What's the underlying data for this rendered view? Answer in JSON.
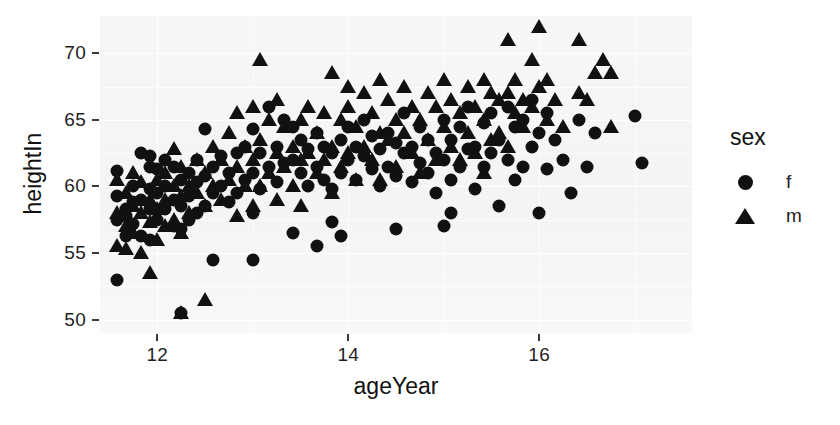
{
  "chart_data": {
    "type": "scatter",
    "title": "",
    "xlabel": "ageYear",
    "ylabel": "heightIn",
    "xlim": [
      11.4,
      17.6
    ],
    "ylim": [
      49.0,
      72.8
    ],
    "xticks": [
      12,
      14,
      16
    ],
    "yticks": [
      50,
      55,
      60,
      65,
      70
    ],
    "xtick_labels": [
      "12",
      "14",
      "16"
    ],
    "ytick_labels": [
      "50",
      "55",
      "60",
      "65",
      "70"
    ],
    "grid": true,
    "grid_major_color": "#ffffff",
    "panel_background": "#f4f4f4",
    "marker_color": "#111111",
    "legend": {
      "title": "sex",
      "position": "right",
      "entries": [
        {
          "label": "f",
          "marker": "circle"
        },
        {
          "label": "m",
          "marker": "triangle"
        }
      ]
    },
    "series": [
      {
        "name": "f",
        "marker": "circle",
        "points": [
          [
            11.92,
            62.3
          ],
          [
            11.92,
            61.5
          ],
          [
            11.58,
            61.2
          ],
          [
            11.58,
            59.3
          ],
          [
            11.58,
            57.5
          ],
          [
            11.67,
            58.3
          ],
          [
            11.67,
            57.8
          ],
          [
            11.67,
            56.3
          ],
          [
            11.75,
            60.0
          ],
          [
            11.75,
            58.8
          ],
          [
            11.75,
            57.2
          ],
          [
            11.83,
            62.5
          ],
          [
            11.83,
            59.0
          ],
          [
            11.83,
            56.3
          ],
          [
            11.92,
            59.8
          ],
          [
            11.92,
            58.3
          ],
          [
            11.92,
            56.0
          ],
          [
            11.58,
            53.0
          ],
          [
            12.0,
            61.3
          ],
          [
            12.0,
            59.5
          ],
          [
            12.0,
            57.5
          ],
          [
            12.08,
            62.0
          ],
          [
            12.08,
            60.0
          ],
          [
            12.08,
            58.3
          ],
          [
            12.17,
            61.5
          ],
          [
            12.17,
            59.0
          ],
          [
            12.17,
            57.0
          ],
          [
            12.25,
            60.5
          ],
          [
            12.25,
            58.5
          ],
          [
            12.25,
            56.8
          ],
          [
            12.25,
            50.5
          ],
          [
            12.33,
            61.0
          ],
          [
            12.33,
            59.3
          ],
          [
            12.33,
            57.5
          ],
          [
            12.42,
            62.0
          ],
          [
            12.42,
            60.3
          ],
          [
            12.42,
            58.0
          ],
          [
            12.5,
            64.3
          ],
          [
            12.5,
            60.8
          ],
          [
            12.5,
            58.5
          ],
          [
            12.58,
            61.5
          ],
          [
            12.58,
            59.5
          ],
          [
            12.58,
            54.5
          ],
          [
            12.67,
            62.3
          ],
          [
            12.67,
            60.0
          ],
          [
            12.75,
            61.0
          ],
          [
            12.75,
            58.8
          ],
          [
            12.83,
            62.5
          ],
          [
            12.83,
            59.5
          ],
          [
            12.92,
            63.0
          ],
          [
            12.92,
            60.5
          ],
          [
            13.0,
            64.3
          ],
          [
            13.0,
            61.0
          ],
          [
            13.0,
            58.0
          ],
          [
            13.0,
            54.5
          ],
          [
            13.08,
            62.5
          ],
          [
            13.08,
            59.8
          ],
          [
            13.17,
            66.0
          ],
          [
            13.17,
            61.5
          ],
          [
            13.25,
            63.0
          ],
          [
            13.25,
            60.3
          ],
          [
            13.33,
            65.0
          ],
          [
            13.33,
            61.8
          ],
          [
            13.42,
            64.5
          ],
          [
            13.42,
            62.0
          ],
          [
            13.42,
            56.5
          ],
          [
            13.5,
            63.5
          ],
          [
            13.5,
            61.0
          ],
          [
            13.58,
            62.8
          ],
          [
            13.58,
            60.0
          ],
          [
            13.67,
            64.0
          ],
          [
            13.67,
            61.5
          ],
          [
            13.67,
            55.5
          ],
          [
            13.75,
            63.0
          ],
          [
            13.75,
            60.5
          ],
          [
            13.83,
            62.5
          ],
          [
            13.83,
            59.8
          ],
          [
            13.92,
            63.5
          ],
          [
            13.92,
            61.0
          ],
          [
            14.0,
            64.5
          ],
          [
            14.0,
            62.0
          ],
          [
            14.08,
            63.0
          ],
          [
            14.08,
            60.5
          ],
          [
            14.17,
            65.0
          ],
          [
            14.17,
            62.3
          ],
          [
            14.25,
            63.8
          ],
          [
            14.25,
            61.3
          ],
          [
            14.33,
            62.8
          ],
          [
            14.33,
            60.0
          ],
          [
            14.42,
            64.0
          ],
          [
            14.42,
            61.5
          ],
          [
            14.5,
            63.3
          ],
          [
            14.5,
            60.8
          ],
          [
            14.58,
            65.5
          ],
          [
            14.58,
            62.5
          ],
          [
            14.67,
            63.0
          ],
          [
            14.67,
            60.3
          ],
          [
            14.75,
            64.5
          ],
          [
            14.75,
            61.8
          ],
          [
            14.83,
            63.5
          ],
          [
            14.83,
            61.0
          ],
          [
            14.92,
            62.5
          ],
          [
            14.92,
            59.5
          ],
          [
            15.0,
            65.0
          ],
          [
            15.0,
            62.0
          ],
          [
            15.08,
            63.5
          ],
          [
            15.08,
            60.5
          ],
          [
            15.17,
            64.5
          ],
          [
            15.17,
            61.5
          ],
          [
            15.25,
            66.0
          ],
          [
            15.25,
            62.8
          ],
          [
            15.33,
            63.0
          ],
          [
            15.33,
            59.8
          ],
          [
            15.42,
            64.8
          ],
          [
            15.42,
            61.5
          ],
          [
            15.5,
            65.5
          ],
          [
            15.5,
            62.5
          ],
          [
            15.58,
            63.5
          ],
          [
            15.58,
            58.5
          ],
          [
            15.67,
            66.0
          ],
          [
            15.67,
            62.0
          ],
          [
            15.75,
            64.5
          ],
          [
            15.75,
            60.5
          ],
          [
            15.83,
            65.0
          ],
          [
            15.83,
            61.5
          ],
          [
            15.92,
            66.5
          ],
          [
            15.92,
            63.0
          ],
          [
            16.0,
            64.0
          ],
          [
            16.0,
            58.0
          ],
          [
            16.08,
            65.5
          ],
          [
            16.08,
            61.3
          ],
          [
            16.17,
            63.5
          ],
          [
            16.25,
            62.0
          ],
          [
            16.33,
            59.5
          ],
          [
            16.42,
            65.0
          ],
          [
            16.5,
            61.5
          ],
          [
            16.58,
            64.0
          ],
          [
            17.0,
            65.3
          ],
          [
            17.08,
            61.8
          ],
          [
            14.5,
            56.8
          ],
          [
            15.0,
            57.0
          ],
          [
            15.08,
            58.0
          ],
          [
            13.83,
            57.3
          ],
          [
            13.92,
            56.3
          ]
        ]
      },
      {
        "name": "m",
        "marker": "triangle",
        "points": [
          [
            11.58,
            55.5
          ],
          [
            11.58,
            58.0
          ],
          [
            11.58,
            60.5
          ],
          [
            11.67,
            59.5
          ],
          [
            11.67,
            57.0
          ],
          [
            11.67,
            55.3
          ],
          [
            11.75,
            61.0
          ],
          [
            11.75,
            58.5
          ],
          [
            11.75,
            56.5
          ],
          [
            11.83,
            60.3
          ],
          [
            11.83,
            58.0
          ],
          [
            11.83,
            55.0
          ],
          [
            11.92,
            59.0
          ],
          [
            11.92,
            57.3
          ],
          [
            11.92,
            53.5
          ],
          [
            12.0,
            60.5
          ],
          [
            12.0,
            58.3
          ],
          [
            12.0,
            56.0
          ],
          [
            12.08,
            61.0
          ],
          [
            12.08,
            59.0
          ],
          [
            12.08,
            57.0
          ],
          [
            12.17,
            62.8
          ],
          [
            12.17,
            60.0
          ],
          [
            12.17,
            57.5
          ],
          [
            12.25,
            61.5
          ],
          [
            12.25,
            59.3
          ],
          [
            12.25,
            56.5
          ],
          [
            12.25,
            50.5
          ],
          [
            12.33,
            60.0
          ],
          [
            12.33,
            58.0
          ],
          [
            12.42,
            62.0
          ],
          [
            12.42,
            59.5
          ],
          [
            12.5,
            61.0
          ],
          [
            12.5,
            58.5
          ],
          [
            12.5,
            51.5
          ],
          [
            12.58,
            63.0
          ],
          [
            12.58,
            60.0
          ],
          [
            12.67,
            62.0
          ],
          [
            12.67,
            59.0
          ],
          [
            12.75,
            64.0
          ],
          [
            12.75,
            60.5
          ],
          [
            12.83,
            65.5
          ],
          [
            12.83,
            61.5
          ],
          [
            12.83,
            57.8
          ],
          [
            12.92,
            63.0
          ],
          [
            12.92,
            60.0
          ],
          [
            13.0,
            66.0
          ],
          [
            13.0,
            62.0
          ],
          [
            13.0,
            58.5
          ],
          [
            13.08,
            69.5
          ],
          [
            13.08,
            63.5
          ],
          [
            13.08,
            60.0
          ],
          [
            13.17,
            65.0
          ],
          [
            13.17,
            61.0
          ],
          [
            13.25,
            66.5
          ],
          [
            13.25,
            62.5
          ],
          [
            13.25,
            59.0
          ],
          [
            13.33,
            64.5
          ],
          [
            13.33,
            61.5
          ],
          [
            13.42,
            63.0
          ],
          [
            13.42,
            60.0
          ],
          [
            13.5,
            65.0
          ],
          [
            13.5,
            62.0
          ],
          [
            13.5,
            58.5
          ],
          [
            13.58,
            66.0
          ],
          [
            13.58,
            62.5
          ],
          [
            13.67,
            64.0
          ],
          [
            13.67,
            61.0
          ],
          [
            13.75,
            65.5
          ],
          [
            13.75,
            62.0
          ],
          [
            13.83,
            68.5
          ],
          [
            13.83,
            63.0
          ],
          [
            13.83,
            59.5
          ],
          [
            13.92,
            65.0
          ],
          [
            13.92,
            61.5
          ],
          [
            14.0,
            66.0
          ],
          [
            14.0,
            62.5
          ],
          [
            14.08,
            64.5
          ],
          [
            14.08,
            60.5
          ],
          [
            14.17,
            67.0
          ],
          [
            14.17,
            63.0
          ],
          [
            14.25,
            65.5
          ],
          [
            14.25,
            62.0
          ],
          [
            14.33,
            64.0
          ],
          [
            14.33,
            60.5
          ],
          [
            14.42,
            66.5
          ],
          [
            14.42,
            63.5
          ],
          [
            14.5,
            65.0
          ],
          [
            14.5,
            61.5
          ],
          [
            14.58,
            67.5
          ],
          [
            14.58,
            64.0
          ],
          [
            14.67,
            66.0
          ],
          [
            14.67,
            62.5
          ],
          [
            14.75,
            65.0
          ],
          [
            14.75,
            61.0
          ],
          [
            14.83,
            67.0
          ],
          [
            14.83,
            63.5
          ],
          [
            14.92,
            66.0
          ],
          [
            14.92,
            62.0
          ],
          [
            15.0,
            68.0
          ],
          [
            15.0,
            64.5
          ],
          [
            15.08,
            66.5
          ],
          [
            15.08,
            63.0
          ],
          [
            15.17,
            65.5
          ],
          [
            15.17,
            62.0
          ],
          [
            15.25,
            67.5
          ],
          [
            15.25,
            64.0
          ],
          [
            15.33,
            66.0
          ],
          [
            15.33,
            62.5
          ],
          [
            15.42,
            68.0
          ],
          [
            15.42,
            65.0
          ],
          [
            15.42,
            61.0
          ],
          [
            15.5,
            67.0
          ],
          [
            15.5,
            63.5
          ],
          [
            15.58,
            66.5
          ],
          [
            15.58,
            64.0
          ],
          [
            15.67,
            71.0
          ],
          [
            15.67,
            67.0
          ],
          [
            15.67,
            63.0
          ],
          [
            15.75,
            68.0
          ],
          [
            15.75,
            65.5
          ],
          [
            15.83,
            66.5
          ],
          [
            15.83,
            64.5
          ],
          [
            15.92,
            69.5
          ],
          [
            15.92,
            66.0
          ],
          [
            16.0,
            72.0
          ],
          [
            16.0,
            67.5
          ],
          [
            16.08,
            68.0
          ],
          [
            16.08,
            65.0
          ],
          [
            16.17,
            66.5
          ],
          [
            16.25,
            64.5
          ],
          [
            16.42,
            71.0
          ],
          [
            16.5,
            66.5
          ],
          [
            16.58,
            68.5
          ],
          [
            16.67,
            69.5
          ],
          [
            16.75,
            68.5
          ],
          [
            16.75,
            64.5
          ],
          [
            16.42,
            67.0
          ],
          [
            14.0,
            67.5
          ],
          [
            14.33,
            68.0
          ]
        ]
      }
    ]
  },
  "axis": {
    "y_title": "heightIn",
    "x_title": "ageYear"
  },
  "legend_ui": {
    "title": "sex",
    "f_label": "f",
    "m_label": "m"
  }
}
